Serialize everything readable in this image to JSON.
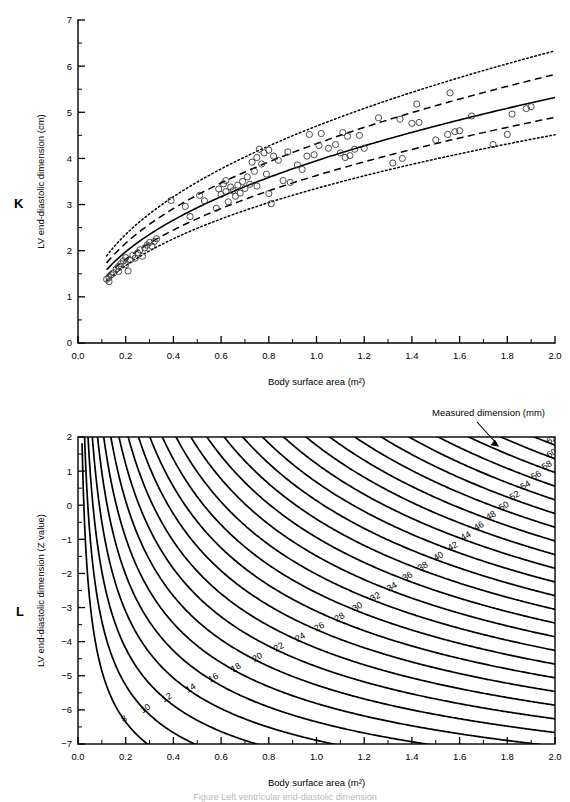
{
  "figure": {
    "panels": [
      "K",
      "L"
    ],
    "caption_partial": "Figure   Left ventricular end-diastolic dimension"
  },
  "panel_k": {
    "letter": "K",
    "xlabel": "Body surface area (m²)",
    "ylabel": "LV end-diastolic dimension (cm)",
    "xticks": [
      "0.0",
      "0.2",
      "0.4",
      "0.6",
      "0.8",
      "1.0",
      "1.2",
      "1.4",
      "1.6",
      "1.8",
      "2.0"
    ],
    "yticks": [
      "0",
      "1",
      "2",
      "3",
      "4",
      "5",
      "6",
      "7"
    ]
  },
  "panel_l": {
    "letter": "L",
    "xlabel": "Body surface area (m²)",
    "ylabel": "LV end-diastolic dimension (Z value)",
    "xticks": [
      "0.0",
      "0.2",
      "0.4",
      "0.6",
      "0.8",
      "1.0",
      "1.2",
      "1.4",
      "1.6",
      "1.8",
      "2.0"
    ],
    "yticks": [
      "2",
      "1",
      "0",
      "−1",
      "−2",
      "−3",
      "−4",
      "−5",
      "−6",
      "−7"
    ],
    "annotation": "Measured dimension (mm)"
  },
  "chart_data": [
    {
      "type": "scatter",
      "panel": "K",
      "title": "",
      "xlabel": "Body surface area (m²)",
      "ylabel": "LV end-diastolic dimension (cm)",
      "xlim": [
        0.0,
        2.0
      ],
      "ylim": [
        0,
        7
      ],
      "xticks": [
        0.0,
        0.2,
        0.4,
        0.6,
        0.8,
        1.0,
        1.2,
        1.4,
        1.6,
        1.8,
        2.0
      ],
      "yticks": [
        0,
        1,
        2,
        3,
        4,
        5,
        6,
        7
      ],
      "minor_ticks": true,
      "grid": false,
      "legend": "none",
      "marker": "open-circle",
      "series": [
        {
          "name": "Observations",
          "style": "open-circle",
          "points": [
            [
              0.12,
              1.38
            ],
            [
              0.13,
              1.42
            ],
            [
              0.13,
              1.33
            ],
            [
              0.14,
              1.48
            ],
            [
              0.15,
              1.52
            ],
            [
              0.16,
              1.6
            ],
            [
              0.17,
              1.66
            ],
            [
              0.17,
              1.55
            ],
            [
              0.18,
              1.72
            ],
            [
              0.19,
              1.78
            ],
            [
              0.2,
              1.7
            ],
            [
              0.2,
              1.85
            ],
            [
              0.21,
              1.56
            ],
            [
              0.22,
              1.8
            ],
            [
              0.23,
              1.9
            ],
            [
              0.24,
              1.84
            ],
            [
              0.25,
              1.95
            ],
            [
              0.26,
              2.02
            ],
            [
              0.27,
              1.88
            ],
            [
              0.28,
              2.06
            ],
            [
              0.29,
              2.12
            ],
            [
              0.3,
              2.18
            ],
            [
              0.31,
              2.1
            ],
            [
              0.32,
              2.2
            ],
            [
              0.33,
              2.26
            ],
            [
              0.39,
              3.09
            ],
            [
              0.45,
              2.96
            ],
            [
              0.47,
              2.74
            ],
            [
              0.51,
              3.2
            ],
            [
              0.53,
              3.08
            ],
            [
              0.58,
              2.92
            ],
            [
              0.59,
              3.34
            ],
            [
              0.6,
              3.22
            ],
            [
              0.61,
              3.45
            ],
            [
              0.62,
              3.52
            ],
            [
              0.62,
              3.28
            ],
            [
              0.63,
              3.06
            ],
            [
              0.64,
              3.38
            ],
            [
              0.65,
              3.3
            ],
            [
              0.66,
              3.18
            ],
            [
              0.67,
              3.42
            ],
            [
              0.68,
              3.25
            ],
            [
              0.69,
              3.5
            ],
            [
              0.7,
              3.35
            ],
            [
              0.71,
              3.6
            ],
            [
              0.72,
              3.44
            ],
            [
              0.73,
              3.92
            ],
            [
              0.74,
              3.72
            ],
            [
              0.75,
              4.02
            ],
            [
              0.75,
              3.4
            ],
            [
              0.76,
              4.2
            ],
            [
              0.77,
              3.88
            ],
            [
              0.78,
              4.12
            ],
            [
              0.79,
              3.66
            ],
            [
              0.8,
              4.18
            ],
            [
              0.8,
              3.24
            ],
            [
              0.81,
              3.02
            ],
            [
              0.82,
              4.05
            ],
            [
              0.84,
              3.96
            ],
            [
              0.86,
              3.52
            ],
            [
              0.88,
              4.14
            ],
            [
              0.89,
              3.48
            ],
            [
              0.92,
              3.86
            ],
            [
              0.94,
              3.76
            ],
            [
              0.96,
              4.05
            ],
            [
              0.97,
              4.52
            ],
            [
              0.99,
              4.08
            ],
            [
              1.01,
              4.28
            ],
            [
              1.02,
              4.54
            ],
            [
              1.05,
              4.22
            ],
            [
              1.08,
              4.3
            ],
            [
              1.1,
              4.12
            ],
            [
              1.11,
              4.56
            ],
            [
              1.12,
              4.02
            ],
            [
              1.13,
              4.48
            ],
            [
              1.14,
              4.06
            ],
            [
              1.16,
              4.2
            ],
            [
              1.18,
              4.5
            ],
            [
              1.2,
              4.22
            ],
            [
              1.26,
              4.88
            ],
            [
              1.32,
              3.9
            ],
            [
              1.35,
              4.85
            ],
            [
              1.36,
              4.0
            ],
            [
              1.4,
              4.76
            ],
            [
              1.42,
              5.18
            ],
            [
              1.43,
              4.78
            ],
            [
              1.5,
              4.4
            ],
            [
              1.55,
              4.52
            ],
            [
              1.56,
              5.42
            ],
            [
              1.58,
              4.58
            ],
            [
              1.6,
              4.6
            ],
            [
              1.65,
              4.92
            ],
            [
              1.74,
              4.3
            ],
            [
              1.8,
              4.52
            ],
            [
              1.82,
              4.96
            ],
            [
              1.88,
              5.08
            ],
            [
              1.9,
              5.12
            ]
          ]
        }
      ],
      "reference_curves": [
        {
          "name": "+2 SD (Z = +2)",
          "style": "dotted",
          "a": 4.7,
          "exp": 0.43
        },
        {
          "name": "+1 SD (Z = +1)",
          "style": "dashed",
          "a": 4.32,
          "exp": 0.43
        },
        {
          "name": "Mean (Z = 0)",
          "style": "solid",
          "a": 3.95,
          "exp": 0.43
        },
        {
          "name": "−1 SD (Z = −1)",
          "style": "dashed",
          "a": 3.63,
          "exp": 0.43
        },
        {
          "name": "−2 SD (Z = −2)",
          "style": "dotted",
          "a": 3.35,
          "exp": 0.43
        }
      ]
    },
    {
      "type": "line",
      "panel": "L",
      "title": "",
      "xlabel": "Body surface area (m²)",
      "ylabel": "LV end-diastolic dimension (Z value)",
      "xlim": [
        0.0,
        2.0
      ],
      "ylim": [
        -7,
        2
      ],
      "xticks": [
        0.0,
        0.2,
        0.4,
        0.6,
        0.8,
        1.0,
        1.2,
        1.4,
        1.6,
        1.8,
        2.0
      ],
      "yticks": [
        2,
        1,
        0,
        -1,
        -2,
        -3,
        -4,
        -5,
        -6,
        -7
      ],
      "minor_ticks": true,
      "grid": false,
      "legend": "none",
      "annotation": "Measured dimension (mm)",
      "contour_variable": "Measured dimension (mm)",
      "contour_levels": [
        8,
        10,
        12,
        14,
        16,
        18,
        20,
        22,
        24,
        26,
        28,
        30,
        32,
        34,
        36,
        38,
        40,
        42,
        44,
        46,
        48,
        50,
        52,
        54,
        56,
        58,
        60,
        62,
        64
      ],
      "model": {
        "mean_cm": "3.95 * BSA^0.43",
        "sd_cm": "0.37 * BSA^0.43",
        "z_formula": "Z = (D_mm/10 - 3.95*BSA^0.43) / (0.37*BSA^0.43)"
      }
    }
  ]
}
